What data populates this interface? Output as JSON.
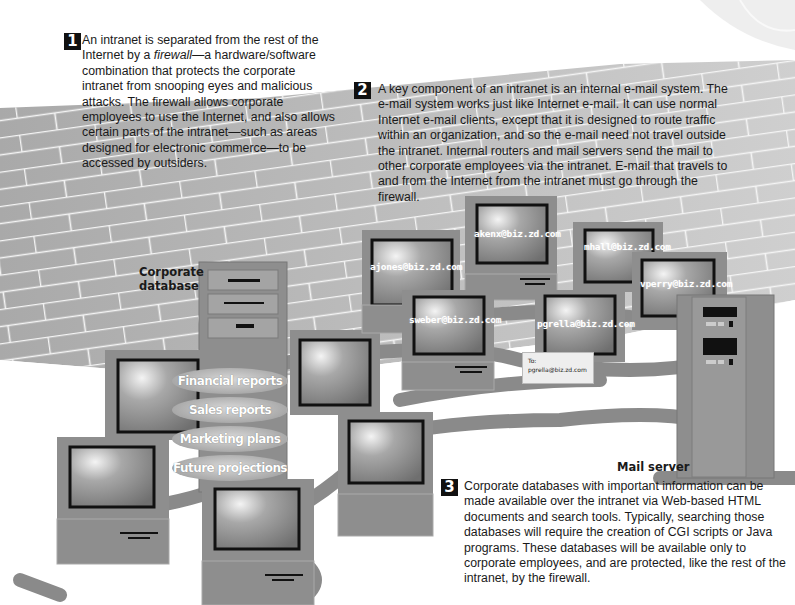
{
  "callouts": [
    {
      "number": "1",
      "text_before": "An intranet is separated from the rest of the Internet by a ",
      "emphasis": "firewall",
      "text_after": "—a hardware/software combination that protects the corporate intranet from snooping eyes and malicious attacks. The firewall allows corporate employees to use the Internet, and also allows certain parts of the intranet—such as areas designed for electronic commerce—to be accessed by outsiders."
    },
    {
      "number": "2",
      "text": "A key component of an intranet is an internal e-mail system. The e-mail system works just like Internet e-mail. It can use normal Internet e-mail clients, except that it is designed to route traffic within an organization, and so the e-mail need not travel outside the intranet. Internal routers and mail servers send the mail to other corporate employees via the intranet. E-mail that travels to and from the Internet from the intranet must go through the firewall."
    },
    {
      "number": "3",
      "text": "Corporate databases with important information can be made available over the intranet via Web-based HTML documents and search tools. Typically, searching those databases will require the creation of CGI scripts or Java programs. These databases will be available only to corporate employees, and are protected, like the rest of the intranet, by the firewall."
    }
  ],
  "labels": {
    "corporate_database": "Corporate database",
    "mail_server": "Mail server"
  },
  "email_addresses": [
    "akenx@biz.zd.com",
    "ajones@biz.zd.com",
    "mhall@biz.zd.com",
    "vperry@biz.zd.com",
    "sweber@biz.zd.com",
    "pgrella@biz.zd.com"
  ],
  "envelope": {
    "to_label": "To:",
    "address": "pgrella@biz.zd.com"
  },
  "database_items": [
    "Financial reports",
    "Sales reports",
    "Marketing plans",
    "Future projections"
  ],
  "colors": {
    "wall": "#b5b5b5",
    "mortar": "#f2f2f2",
    "device": "#8e8e8e",
    "screen_frame": "#111111",
    "cable": "#8a8a8a",
    "text": "#1a1a1a"
  }
}
